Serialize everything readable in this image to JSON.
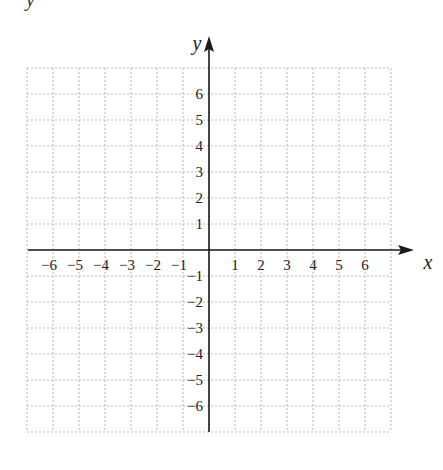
{
  "corner_label": "y",
  "chart_data": {
    "type": "coordinate-grid",
    "title": "",
    "xlabel": "x",
    "ylabel": "y",
    "xlim": [
      -7,
      7
    ],
    "ylim": [
      -7,
      7
    ],
    "grid": true,
    "grid_style": "dotted",
    "x_ticks": [
      -6,
      -5,
      -4,
      -3,
      -2,
      -1,
      1,
      2,
      3,
      4,
      5,
      6
    ],
    "y_ticks": [
      6,
      5,
      4,
      3,
      2,
      1,
      -1,
      -2,
      -3,
      -4,
      -5,
      -6
    ],
    "x_tick_labels": [
      "−6",
      "−5",
      "−4",
      "−3",
      "−2",
      "−1",
      "1",
      "2",
      "3",
      "4",
      "5",
      "6"
    ],
    "y_tick_labels": [
      "6",
      "5",
      "4",
      "3",
      "2",
      "1",
      "−1",
      "−2",
      "−3",
      "−4",
      "−5",
      "−6"
    ]
  },
  "colors": {
    "axis": "#1a1a1a",
    "grid": "#b8b8b8",
    "text": "#222222"
  }
}
